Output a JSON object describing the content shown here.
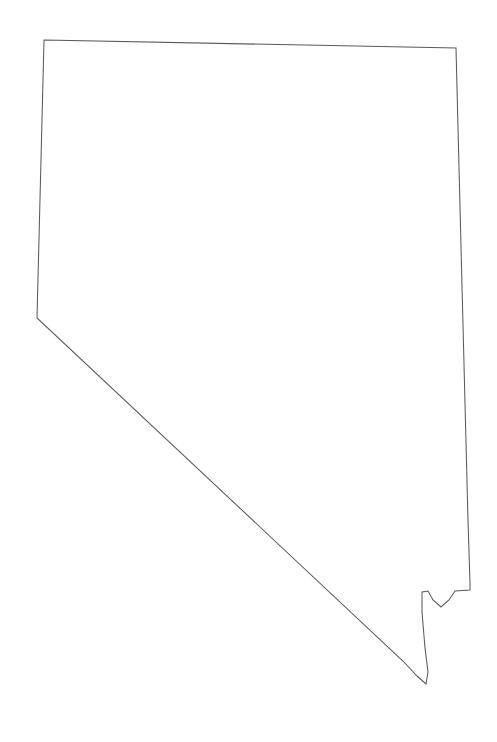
{
  "figure": {
    "kind": "hachure-relief-map",
    "canvas_width": 497,
    "canvas_height": 742,
    "background_color": "#ffffff",
    "outline_color": "#5a5a5a",
    "outline_width": 1.05,
    "hachure_color_dark": "#4a4a4a",
    "hachure_color_mid": "#6f6f6f",
    "hachure_color_light": "#9a9a9a",
    "caption": "",
    "title": "",
    "legend": "",
    "labels": []
  },
  "chart_data": {
    "type": "map",
    "title": "",
    "subtitle": "",
    "xlabel": "",
    "ylabel": "",
    "legend_position": "none",
    "grid": false,
    "projection_note": "plain outline, north up",
    "state_outline_points": [
      [
        44,
        40
      ],
      [
        456,
        48
      ],
      [
        462,
        286
      ],
      [
        468,
        520
      ],
      [
        470,
        583
      ],
      [
        470,
        590
      ],
      [
        455,
        591
      ],
      [
        449,
        600
      ],
      [
        441,
        607
      ],
      [
        433,
        600
      ],
      [
        428,
        591
      ],
      [
        422,
        592
      ],
      [
        422,
        612
      ],
      [
        425,
        648
      ],
      [
        428,
        672
      ],
      [
        426,
        684
      ],
      [
        417,
        676
      ],
      [
        404,
        662
      ],
      [
        37,
        318
      ],
      [
        44,
        40
      ]
    ],
    "boundary_segments": [
      {
        "name": "north-border-oregon-idaho",
        "from": [
          44,
          40
        ],
        "to": [
          456,
          48
        ]
      },
      {
        "name": "east-border-utah-arizona",
        "from": [
          456,
          48
        ],
        "to": [
          470,
          590
        ]
      },
      {
        "name": "southeast-notch-colorado-river",
        "from": [
          470,
          590
        ],
        "to": [
          422,
          592
        ]
      },
      {
        "name": "south-tip-colorado-river",
        "from": [
          422,
          592
        ],
        "to": [
          426,
          684
        ]
      },
      {
        "name": "southwest-diagonal-california",
        "from": [
          426,
          684
        ],
        "to": [
          37,
          318
        ]
      },
      {
        "name": "west-border-california-oregon",
        "from": [
          37,
          318
        ],
        "to": [
          44,
          40
        ]
      }
    ],
    "relief_description": "Basin and Range hachure ticks in roughly north-south ridge chains; density increases toward the east and south-center, sparsest in the northwest basins.",
    "ridge_density_regions": [
      {
        "region": "northwest",
        "relative_density": 0.28
      },
      {
        "region": "north-central",
        "relative_density": 0.55
      },
      {
        "region": "northeast",
        "relative_density": 0.72
      },
      {
        "region": "west-central",
        "relative_density": 0.45
      },
      {
        "region": "central",
        "relative_density": 0.7
      },
      {
        "region": "east-central",
        "relative_density": 0.95
      },
      {
        "region": "southwest",
        "relative_density": 0.5
      },
      {
        "region": "south-central",
        "relative_density": 0.8
      },
      {
        "region": "southeast",
        "relative_density": 0.9
      }
    ],
    "ridge_count_estimate": 190,
    "hachure_tick_count_estimate": 5200,
    "ridge_orientation_degrees": {
      "northwest": 30,
      "north_central": 12,
      "northeast": 8,
      "central": 5,
      "southeast": -8,
      "southwest": -18
    }
  }
}
